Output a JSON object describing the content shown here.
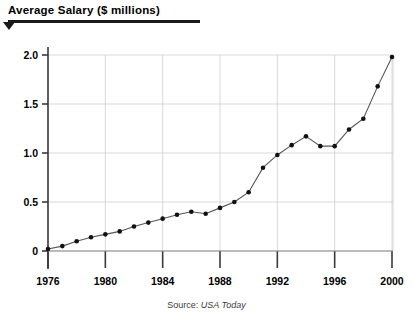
{
  "header": {
    "title": "Average Salary ($ millions)",
    "arrow_icon": "triangle-down-icon"
  },
  "source": {
    "label": "Source:",
    "name": "USA Today"
  },
  "colors": {
    "line": "#555555",
    "point": "#111111",
    "grid": "#c9c9c9",
    "axis": "#3a3a3a",
    "title_rule": "#1a1a1a",
    "background": "#ffffff"
  },
  "chart_data": {
    "type": "line",
    "title": "Average Salary ($ millions)",
    "xlabel": "",
    "ylabel": "",
    "xlim": [
      1976,
      2000
    ],
    "ylim": [
      0,
      2.0
    ],
    "yticks": [
      0,
      0.5,
      1.0,
      1.5,
      2.0
    ],
    "ytick_labels": [
      "0",
      "0.5",
      "1.0",
      "1.5",
      "2.0"
    ],
    "xticks": [
      1976,
      1980,
      1984,
      1988,
      1992,
      1996,
      2000
    ],
    "xtick_labels": [
      "1976",
      "1980",
      "1984",
      "1988",
      "1992",
      "1996",
      "2000"
    ],
    "grid": true,
    "legend": false,
    "markers": true,
    "x": [
      1976,
      1977,
      1978,
      1979,
      1980,
      1981,
      1982,
      1983,
      1984,
      1985,
      1986,
      1987,
      1988,
      1989,
      1990,
      1991,
      1992,
      1993,
      1994,
      1995,
      1996,
      1997,
      1998,
      1999,
      2000
    ],
    "values": [
      0.02,
      0.05,
      0.1,
      0.14,
      0.17,
      0.2,
      0.25,
      0.29,
      0.33,
      0.37,
      0.4,
      0.38,
      0.44,
      0.5,
      0.6,
      0.85,
      0.98,
      1.08,
      1.17,
      1.07,
      1.07,
      1.24,
      1.35,
      1.68,
      1.98
    ],
    "series": [
      {
        "name": "Average Salary",
        "values": [
          0.02,
          0.05,
          0.1,
          0.14,
          0.17,
          0.2,
          0.25,
          0.29,
          0.33,
          0.37,
          0.4,
          0.38,
          0.44,
          0.5,
          0.6,
          0.85,
          0.98,
          1.08,
          1.17,
          1.07,
          1.07,
          1.24,
          1.35,
          1.68,
          1.98
        ]
      }
    ]
  }
}
